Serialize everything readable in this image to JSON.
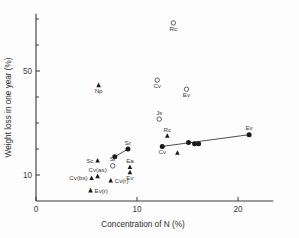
{
  "chart_data": {
    "type": "scatter",
    "title": "",
    "xlabel": "Concentration of N (%)",
    "ylabel": "Weight loss in one year (%)",
    "xlim": [
      0,
      23.5
    ],
    "ylim": [
      0,
      72
    ],
    "xticks": [
      0,
      10,
      20
    ],
    "xticklabels": [
      "0",
      "10",
      "20"
    ],
    "yticks": [
      10,
      50
    ],
    "yticklabels": [
      "10",
      "50"
    ],
    "yminorticks": [
      20,
      30,
      40,
      60,
      70
    ],
    "grid": false,
    "legend": null,
    "series": [
      {
        "name": "open-circle",
        "marker": "open-circle",
        "points": [
          {
            "label": "Rc",
            "label_pos": "below",
            "x": 13.6,
            "y": 68.5
          },
          {
            "label": "Cv",
            "label_pos": "below",
            "x": 12.0,
            "y": 46.5
          },
          {
            "label": "Ev",
            "label_pos": "below",
            "x": 14.9,
            "y": 43.0
          },
          {
            "label": "Js",
            "label_pos": "above",
            "x": 12.2,
            "y": 31.5
          },
          {
            "label": "Sr",
            "label_pos": "above",
            "x": 7.6,
            "y": 13.5
          }
        ]
      },
      {
        "name": "filled-triangle",
        "marker": "triangle",
        "points": [
          {
            "label": "Np",
            "label_pos": "below",
            "x": 6.2,
            "y": 44.5
          },
          {
            "label": "Rc",
            "label_pos": "above",
            "x": 13.0,
            "y": 25.0
          },
          {
            "label": "",
            "label_pos": "none",
            "x": 14.0,
            "y": 18.5
          },
          {
            "label": "Sc",
            "label_pos": "left",
            "x": 6.1,
            "y": 15.5
          },
          {
            "label": "Ea",
            "label_pos": "above",
            "x": 9.3,
            "y": 13.0
          },
          {
            "label": "Ev",
            "label_pos": "below",
            "x": 9.3,
            "y": 11.0
          },
          {
            "label": "Cv(as)",
            "label_pos": "above",
            "x": 6.1,
            "y": 9.5
          },
          {
            "label": "Cv(bs)",
            "label_pos": "left",
            "x": 5.5,
            "y": 8.8
          },
          {
            "label": "Cv(r)",
            "label_pos": "right",
            "x": 7.4,
            "y": 7.8
          },
          {
            "label": "Ev(r)",
            "label_pos": "right",
            "x": 5.4,
            "y": 4.0
          }
        ]
      },
      {
        "name": "filled-circle",
        "marker": "filled-circle",
        "points": [
          {
            "label": "",
            "label_pos": "none",
            "x": 7.8,
            "y": 17.0
          },
          {
            "label": "Sr",
            "label_pos": "above",
            "x": 9.1,
            "y": 20.0
          },
          {
            "label": "Cv",
            "label_pos": "below",
            "x": 12.5,
            "y": 21.0
          },
          {
            "label": "",
            "label_pos": "none",
            "x": 15.1,
            "y": 22.5
          },
          {
            "label": "",
            "label_pos": "none",
            "x": 15.7,
            "y": 22.0
          },
          {
            "label": "",
            "label_pos": "none",
            "x": 16.1,
            "y": 22.0
          },
          {
            "label": "Ev",
            "label_pos": "above",
            "x": 21.1,
            "y": 25.5
          }
        ]
      }
    ],
    "fit_lines": [
      {
        "name": "sr-trend",
        "x1": 7.8,
        "y1": 17.0,
        "x2": 9.1,
        "y2": 20.0
      },
      {
        "name": "ev-trend",
        "x1": 12.5,
        "y1": 21.0,
        "x2": 21.1,
        "y2": 25.5
      }
    ]
  }
}
